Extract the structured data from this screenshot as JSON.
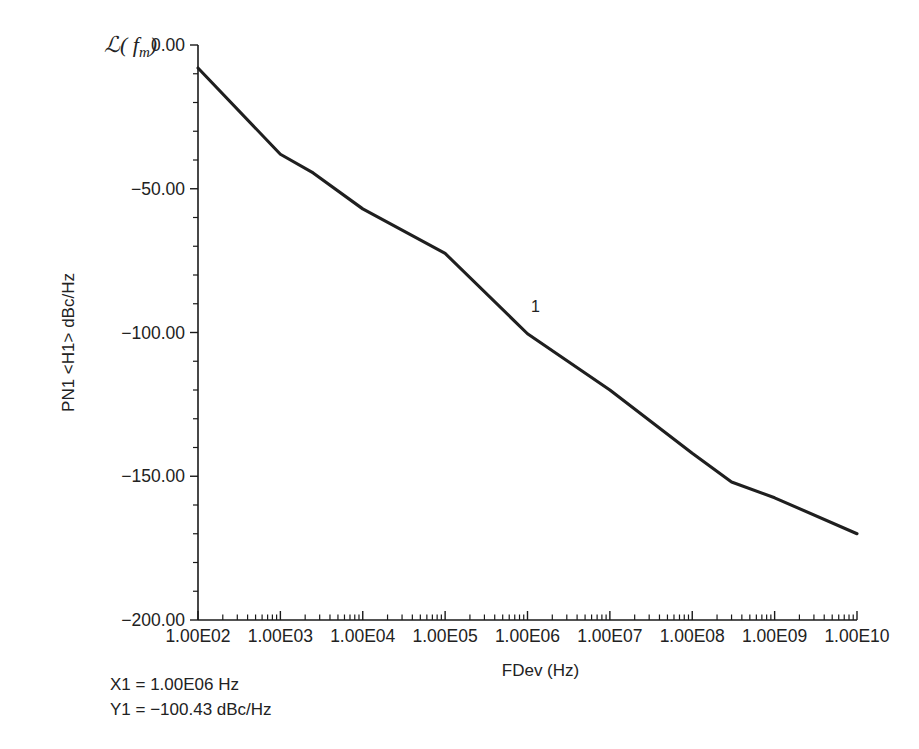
{
  "chart_data": {
    "type": "line",
    "title": "",
    "xlabel": "FDev (Hz)",
    "ylabel": "PN1 <H1> dBc/Hz",
    "ylabel_symbol": "ℒ( f",
    "ylabel_symbol_sub": "m",
    "ylabel_symbol_end": ")",
    "xscale": "log",
    "yscale": "linear",
    "xlim": [
      100,
      10000000000
    ],
    "ylim": [
      -200,
      0
    ],
    "grid": false,
    "legend": null,
    "x_tick_labels": [
      "1.00E02",
      "1.00E03",
      "1.00E04",
      "1.00E05",
      "1.00E06",
      "1.00E07",
      "1.00E08",
      "1.00E09",
      "1.00E10"
    ],
    "x_tick_values": [
      100,
      1000,
      10000,
      100000,
      1000000,
      10000000,
      100000000,
      1000000000,
      10000000000
    ],
    "y_tick_labels": [
      "0.00",
      "−50.00",
      "−100.00",
      "−150.00",
      "−200.00"
    ],
    "y_tick_values": [
      0,
      -50,
      -100,
      -150,
      -200
    ],
    "y_minor_per_major": 5,
    "series": [
      {
        "name": "PN1 <H1>",
        "color": "#1f1f1f",
        "x": [
          100,
          1000,
          2500,
          10000,
          100000,
          1000000,
          10000000,
          100000000,
          300000000,
          1000000000,
          10000000000
        ],
        "y": [
          -8.0,
          -38.0,
          -44.5,
          -57.0,
          -72.5,
          -100.43,
          -120.0,
          -142.0,
          -152.0,
          -157.5,
          -170.0
        ]
      }
    ],
    "annotations": [
      {
        "name": "marker-1",
        "label": "1",
        "x": 1000000,
        "y": -100.43,
        "dx": 8,
        "dy": -22
      }
    ]
  },
  "readout": {
    "x_line": "X1 = 1.00E06 Hz",
    "y_line": "Y1 = −100.43 dBc/Hz"
  }
}
